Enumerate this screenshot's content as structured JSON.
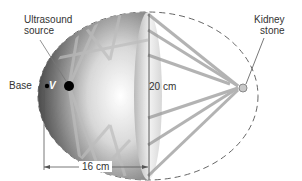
{
  "diagram": {
    "labels": {
      "ultrasound_source_line1": "Ultrasound",
      "ultrasound_source_line2": "source",
      "kidney_stone_line1": "Kidney",
      "kidney_stone_line2": "stone",
      "base": "Base",
      "vertex_symbol": "V",
      "height_dimension": "20 cm",
      "width_dimension": "16 cm"
    },
    "colors": {
      "ellipse_dark": "#3a3a3a",
      "ellipse_light": "#f0f0f0",
      "ray": "#8a8a8a",
      "dashed_outline": "#666666",
      "dimension_line": "#555555"
    }
  }
}
